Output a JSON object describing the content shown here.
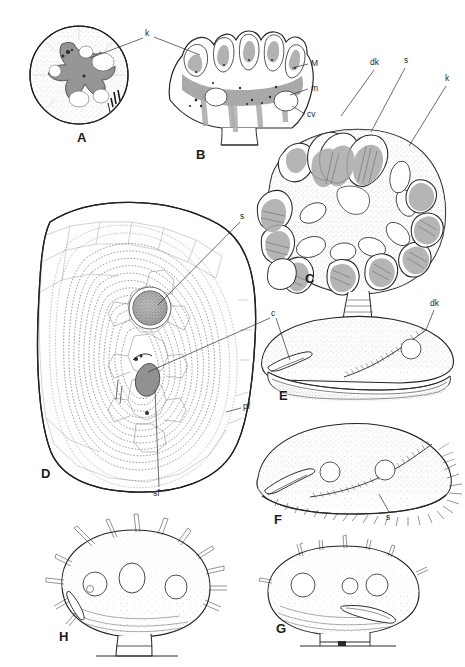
{
  "plate": {
    "title": "Scientific illustration plate of pollen / spore morphology",
    "background_color": "#ffffff",
    "ink_color": "#2b2b2b",
    "width": 465,
    "height": 667
  },
  "figures": [
    {
      "id": "A",
      "letter": "A",
      "letter_x": 77,
      "letter_y": 131,
      "caption": "polar view of grain showing stellate aperture",
      "type": "circular-stippled-grain"
    },
    {
      "id": "B",
      "letter": "B",
      "letter_x": 196,
      "letter_y": 148,
      "caption": "sectional view with lobed margin",
      "type": "sectioned-lobed-structure"
    },
    {
      "id": "C",
      "letter": "C",
      "letter_x": 305,
      "letter_y": 272,
      "caption": "whole body with radiating bean-shaped appendages",
      "type": "globular-with-appendages"
    },
    {
      "id": "D",
      "letter": "D",
      "letter_x": 41,
      "letter_y": 467,
      "caption": "large ovate grain with concentric striations and central pore",
      "type": "ovate-striated-grain"
    },
    {
      "id": "E",
      "letter": "E",
      "letter_x": 279,
      "letter_y": 389,
      "caption": "lateral view, smooth surface",
      "type": "lateral-view-smooth"
    },
    {
      "id": "F",
      "letter": "F",
      "letter_x": 274,
      "letter_y": 513,
      "caption": "lateral view, spiny posterior",
      "type": "lateral-view-spiny"
    },
    {
      "id": "G",
      "letter": "G",
      "letter_x": 276,
      "letter_y": 622,
      "caption": "lateral view with short spines and basal stalk",
      "type": "stalked-short-spined"
    },
    {
      "id": "H",
      "letter": "H",
      "letter_x": 59,
      "letter_y": 630,
      "caption": "lateral view with long spines and basal stalk",
      "type": "stalked-long-spined"
    }
  ],
  "leader_labels": [
    {
      "text": "k",
      "x": 145,
      "y": 33,
      "figure": "A-B",
      "meaning": "aperture-label-k"
    },
    {
      "text": "M",
      "x": 311,
      "y": 63,
      "figure": "B",
      "meaning": "major-lobe-label-M"
    },
    {
      "text": "m",
      "x": 311,
      "y": 87,
      "figure": "B",
      "meaning": "minor-lobe-label-m"
    },
    {
      "text": "cv",
      "x": 307,
      "y": 115,
      "figure": "B",
      "meaning": "cavity-label-cv"
    },
    {
      "text": "dk",
      "x": 373,
      "y": 62,
      "figure": "C",
      "meaning": "distal-appendage-label-dk"
    },
    {
      "text": "s",
      "x": 406,
      "y": 60,
      "figure": "C",
      "meaning": "spine-label-s"
    },
    {
      "text": "k",
      "x": 447,
      "y": 78,
      "figure": "C",
      "meaning": "aperture-label-k"
    },
    {
      "text": "s",
      "x": 241,
      "y": 216,
      "figure": "D",
      "meaning": "spine-label-s"
    },
    {
      "text": "c",
      "x": 272,
      "y": 313,
      "figure": "D-E",
      "meaning": "colpus-label-c"
    },
    {
      "text": "pf",
      "x": 243,
      "y": 406,
      "figure": "D",
      "meaning": "primary-fold-label-pf"
    },
    {
      "text": "sf",
      "x": 156,
      "y": 493,
      "figure": "D",
      "meaning": "secondary-fold-label-sf"
    },
    {
      "text": "dk",
      "x": 432,
      "y": 303,
      "figure": "E",
      "meaning": "distal-keel-label-dk"
    },
    {
      "text": "s",
      "x": 388,
      "y": 516,
      "figure": "F",
      "meaning": "spine-label-s"
    }
  ]
}
